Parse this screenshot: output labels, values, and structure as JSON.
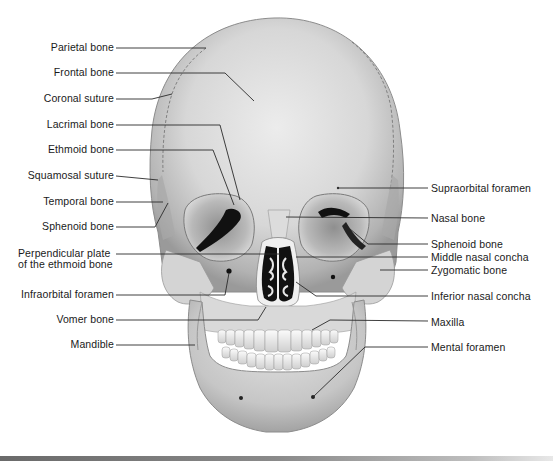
{
  "diagram": {
    "colors": {
      "bone_light": "#e6e6e6",
      "bone_mid": "#c9c9c9",
      "bone_shadow": "#9e9e9e",
      "cavity": "#111111",
      "leader_line": "#2a2a2a",
      "text": "#1a1a1a",
      "bottom_bar": "#7a7a7a"
    },
    "left_labels": [
      {
        "id": "parietal-bone",
        "text": "Parietal bone",
        "x": 114,
        "y": 47
      },
      {
        "id": "frontal-bone",
        "text": "Frontal bone",
        "x": 114,
        "y": 72
      },
      {
        "id": "coronal-suture",
        "text": "Coronal suture",
        "x": 114,
        "y": 98
      },
      {
        "id": "lacrimal-bone",
        "text": "Lacrimal bone",
        "x": 114,
        "y": 124
      },
      {
        "id": "ethmoid-bone",
        "text": "Ethmoid bone",
        "x": 114,
        "y": 149
      },
      {
        "id": "squamosal-suture",
        "text": "Squamosal suture",
        "x": 114,
        "y": 175
      },
      {
        "id": "temporal-bone",
        "text": "Temporal bone",
        "x": 114,
        "y": 201
      },
      {
        "id": "sphenoid-bone-left",
        "text": "Sphenoid bone",
        "x": 114,
        "y": 226
      },
      {
        "id": "perpendicular-plate-line1",
        "text": "Perpendicular plate",
        "x": 114,
        "y": 253
      },
      {
        "id": "perpendicular-plate-line2",
        "text": "of the ethmoid  bone",
        "x": 114,
        "y": 265
      },
      {
        "id": "infraorbital-foramen",
        "text": "Infraorbital foramen",
        "x": 114,
        "y": 294
      },
      {
        "id": "vomer-bone",
        "text": "Vomer bone",
        "x": 114,
        "y": 319
      },
      {
        "id": "mandible",
        "text": "Mandible",
        "x": 114,
        "y": 344
      }
    ],
    "right_labels": [
      {
        "id": "supraorbital-foramen",
        "text": "Supraorbital foramen",
        "x": 431,
        "y": 188
      },
      {
        "id": "nasal-bone",
        "text": "Nasal bone",
        "x": 431,
        "y": 218
      },
      {
        "id": "sphenoid-bone-right",
        "text": "Sphenoid bone",
        "x": 431,
        "y": 244
      },
      {
        "id": "middle-nasal-concha",
        "text": "Middle nasal concha",
        "x": 431,
        "y": 257
      },
      {
        "id": "zygomatic-bone",
        "text": "Zygomatic bone",
        "x": 431,
        "y": 270
      },
      {
        "id": "inferior-nasal-concha",
        "text": "Inferior nasal concha",
        "x": 431,
        "y": 296
      },
      {
        "id": "maxilla",
        "text": "Maxilla",
        "x": 431,
        "y": 322
      },
      {
        "id": "mental-foramen",
        "text": "Mental foramen",
        "x": 431,
        "y": 347
      }
    ],
    "leader_lines": [
      {
        "id": "parietal-bone",
        "points": "116,48 206,48"
      },
      {
        "id": "frontal-bone",
        "points": "116,73 225,73 254,101"
      },
      {
        "id": "coronal-suture",
        "points": "116,99 152,99 172,94"
      },
      {
        "id": "lacrimal-bone",
        "points": "116,125 220,125 240,200"
      },
      {
        "id": "ethmoid-bone",
        "points": "116,150 213,150 234,205"
      },
      {
        "id": "squamosal-suture",
        "points": "116,176 158,180"
      },
      {
        "id": "temporal-bone",
        "points": "116,202 163,202"
      },
      {
        "id": "sphenoid-bone-left",
        "points": "116,227 155,227 168,203"
      },
      {
        "id": "perpendicular-plate",
        "points": "116,254 280,254"
      },
      {
        "id": "infraorbital-foramen",
        "points": "116,295 225,295 229,273"
      },
      {
        "id": "vomer-bone",
        "points": "116,320 258,320 266,307"
      },
      {
        "id": "mandible",
        "points": "116,345 195,345"
      },
      {
        "id": "supraorbital-foramen",
        "points": "338,188 428,188"
      },
      {
        "id": "nasal-bone",
        "points": "286,217 428,218"
      },
      {
        "id": "sphenoid-bone-right",
        "points": "350,229 368,244 428,244"
      },
      {
        "id": "middle-nasal-concha",
        "points": "296,257 428,257"
      },
      {
        "id": "zygomatic-bone",
        "points": "380,270 428,270"
      },
      {
        "id": "inferior-nasal-concha",
        "points": "296,282 316,296 428,296"
      },
      {
        "id": "maxilla",
        "points": "312,330 330,320 428,321"
      },
      {
        "id": "mental-foramen",
        "points": "313,397 365,347 428,347"
      }
    ]
  }
}
